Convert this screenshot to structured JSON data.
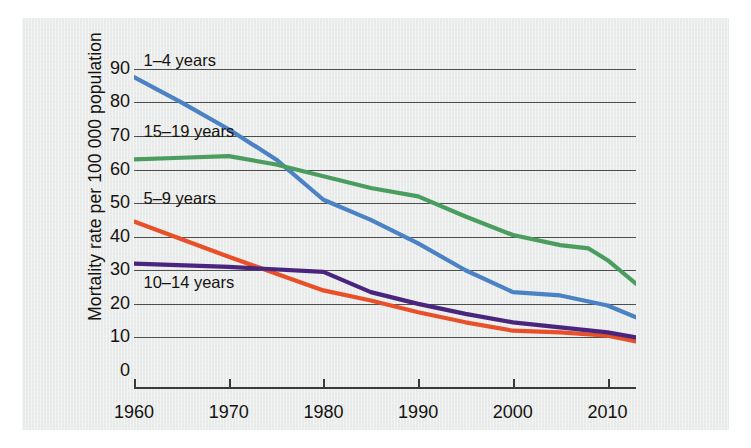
{
  "chart_data": {
    "type": "line",
    "title": "",
    "xlabel": "",
    "ylabel": "Mortality rate per 100 000 population",
    "xlim": [
      1960,
      2013
    ],
    "ylim": [
      0,
      95
    ],
    "yticks": [
      0,
      10,
      20,
      30,
      40,
      50,
      60,
      70,
      80,
      90
    ],
    "xticks": [
      1960,
      1970,
      1980,
      1990,
      2000,
      2010
    ],
    "grid": "horizontal",
    "legend_position": "inline-labels",
    "series": [
      {
        "name": "1–4 years",
        "color": "#4B82C4",
        "label_x": 1961,
        "label_y": 92,
        "x": [
          1960,
          1965,
          1970,
          1975,
          1980,
          1985,
          1990,
          1995,
          2000,
          2005,
          2010,
          2013
        ],
        "values": [
          87.5,
          80.0,
          72.0,
          63.0,
          51.0,
          45.0,
          38.0,
          30.0,
          23.5,
          22.5,
          19.5,
          16.0
        ]
      },
      {
        "name": "15–19 years",
        "color": "#4A9D5E",
        "label_x": 1961,
        "label_y": 71,
        "x": [
          1960,
          1965,
          1970,
          1975,
          1980,
          1985,
          1990,
          1995,
          2000,
          2005,
          2008,
          2010,
          2013
        ],
        "values": [
          63.0,
          63.5,
          64.0,
          61.5,
          58.0,
          54.5,
          52.0,
          46.0,
          40.5,
          37.5,
          36.5,
          33.0,
          26.0
        ]
      },
      {
        "name": "5–9 years",
        "color": "#E8502A",
        "label_x": 1961,
        "label_y": 51,
        "x": [
          1960,
          1970,
          1980,
          1985,
          1990,
          1995,
          2000,
          2005,
          2010,
          2013
        ],
        "values": [
          44.5,
          34.0,
          24.0,
          21.0,
          17.5,
          14.5,
          12.0,
          11.5,
          10.5,
          8.8
        ]
      },
      {
        "name": "10–14 years",
        "color": "#49257D",
        "label_x": 1961,
        "label_y": 26,
        "x": [
          1960,
          1970,
          1980,
          1985,
          1990,
          1995,
          2000,
          2005,
          2010,
          2013
        ],
        "values": [
          32.0,
          31.0,
          29.5,
          23.5,
          20.0,
          17.0,
          14.5,
          13.0,
          11.5,
          10.0
        ]
      }
    ]
  }
}
